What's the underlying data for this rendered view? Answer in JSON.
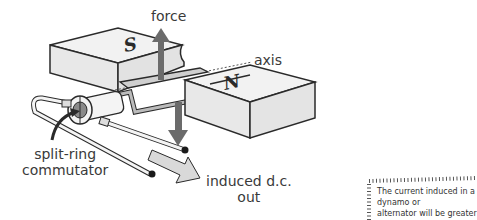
{
  "diagram": {
    "type": "dynamo-dc-generator",
    "labels": {
      "force": "force",
      "axis": "axis",
      "commutator_line1": "split-ring",
      "commutator_line2": "commutator",
      "output_line1": "induced d.c.",
      "output_line2": "out"
    },
    "magnets": {
      "left_pole": "S",
      "right_pole": "N"
    },
    "note": {
      "line1": "The current induced in a dynamo or",
      "line2": "alternator will be greater if there are"
    },
    "colors": {
      "outline": "#2a2a2a",
      "magnet_fill": "#f2f2f2",
      "magnet_side": "#e4e4e4",
      "force_arrow": "#6b6b6b",
      "output_arrow": "#d9d9d9",
      "commutator_fill": "#8a8a8a",
      "text": "#3a3a3a"
    }
  }
}
